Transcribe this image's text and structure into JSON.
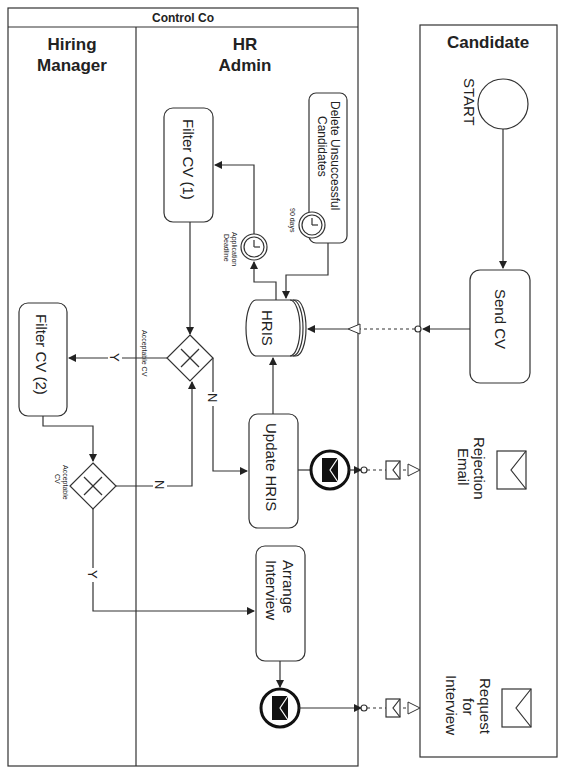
{
  "diagram": {
    "type": "BPMN collaboration (rotated 90°)",
    "pool_main": {
      "title": "Control Co"
    },
    "lanes": [
      {
        "id": "hiring_manager",
        "title_line1": "Hiring",
        "title_line2": "Manager"
      },
      {
        "id": "hr_admin",
        "title_line1": "HR",
        "title_line2": "Admin"
      }
    ],
    "pool_candidate": {
      "title": "Candidate"
    },
    "nodes": {
      "start": {
        "label": "START"
      },
      "send_cv": {
        "label": "Send CV"
      },
      "hris": {
        "label": "HRIS"
      },
      "filter_cv_1": {
        "label": "Filter CV (1)"
      },
      "filter_cv_2": {
        "label": "Filter CV (2)"
      },
      "delete_unsuccessful": {
        "line1": "Delete Unsuccessful",
        "line2": "Candidates"
      },
      "timer_deadline": {
        "line1": "Application",
        "line2": "Deadline"
      },
      "timer_90": {
        "label": "90 days"
      },
      "gateway_1": {
        "label": "Acceptable CV"
      },
      "gateway_2": {
        "line1": "Acceptable",
        "line2": "CV"
      },
      "update_hris": {
        "label": "Update HRIS"
      },
      "arrange_interview": {
        "line1": "Arrange",
        "line2": "Interview"
      },
      "rejection_email": {
        "line1": "Rejection",
        "line2": "Email"
      },
      "request_interview": {
        "line1": "Request",
        "line2": "for",
        "line3": "Interview"
      }
    },
    "edge_labels": {
      "g1_yes": "Y",
      "g1_no": "N",
      "g2_yes": "Y",
      "g2_no": "N"
    },
    "colors": {
      "line": "#333333",
      "background": "#ffffff",
      "event_fill": "#111111"
    }
  }
}
